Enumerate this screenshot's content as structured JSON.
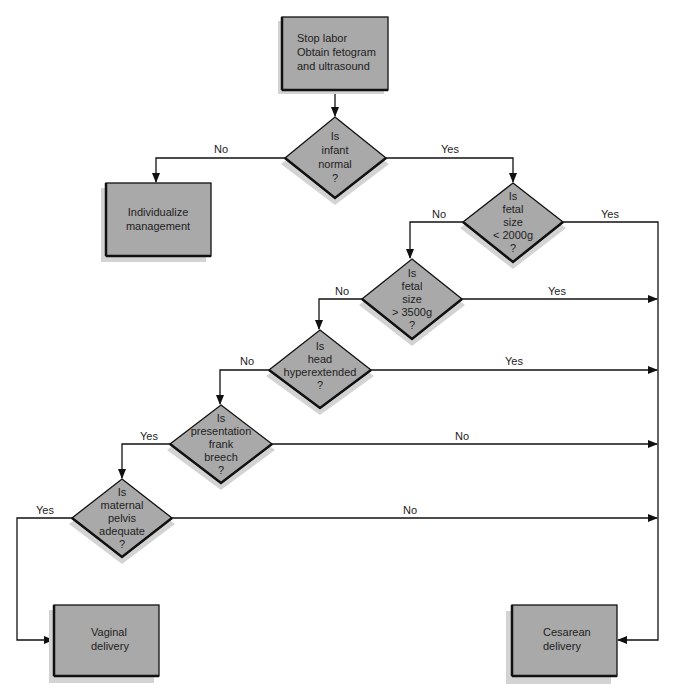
{
  "colors": {
    "node_fill": "#a9a9a9",
    "shadow": "#d3d3d3",
    "stroke": "#111111",
    "background": "#ffffff"
  },
  "nodes": {
    "start": {
      "type": "process",
      "lines": [
        "Stop labor",
        "Obtain fetogram",
        "and ultrasound"
      ]
    },
    "individualize": {
      "type": "process",
      "lines": [
        "Individualize",
        "management"
      ]
    },
    "q_infant_normal": {
      "type": "decision",
      "lines": [
        "Is",
        "infant",
        "normal",
        "?"
      ]
    },
    "q_size_lt_2000": {
      "type": "decision",
      "lines": [
        "Is",
        "fetal",
        "size",
        "< 2000g",
        "?"
      ]
    },
    "q_size_gt_3500": {
      "type": "decision",
      "lines": [
        "Is",
        "fetal",
        "size",
        "> 3500g",
        "?"
      ]
    },
    "q_head_hyperextended": {
      "type": "decision",
      "lines": [
        "Is",
        "head",
        "hyperextended",
        "?"
      ]
    },
    "q_frank_breech": {
      "type": "decision",
      "lines": [
        "Is",
        "presentation",
        "frank",
        "breech",
        "?"
      ]
    },
    "q_pelvis_adequate": {
      "type": "decision",
      "lines": [
        "Is",
        "maternal",
        "pelvis",
        "adequate",
        "?"
      ]
    },
    "vaginal": {
      "type": "terminal",
      "lines": [
        "Vaginal",
        "delivery"
      ]
    },
    "cesarean": {
      "type": "terminal",
      "lines": [
        "Cesarean",
        "delivery"
      ]
    }
  },
  "edges": [
    {
      "from": "start",
      "to": "q_infant_normal",
      "label": ""
    },
    {
      "from": "q_infant_normal",
      "to": "individualize",
      "label": "No"
    },
    {
      "from": "q_infant_normal",
      "to": "q_size_lt_2000",
      "label": "Yes"
    },
    {
      "from": "q_size_lt_2000",
      "to": "cesarean",
      "label": "Yes"
    },
    {
      "from": "q_size_lt_2000",
      "to": "q_size_gt_3500",
      "label": "No"
    },
    {
      "from": "q_size_gt_3500",
      "to": "cesarean",
      "label": "Yes"
    },
    {
      "from": "q_size_gt_3500",
      "to": "q_head_hyperextended",
      "label": "No"
    },
    {
      "from": "q_head_hyperextended",
      "to": "cesarean",
      "label": "Yes"
    },
    {
      "from": "q_head_hyperextended",
      "to": "q_frank_breech",
      "label": "No"
    },
    {
      "from": "q_frank_breech",
      "to": "q_pelvis_adequate",
      "label": "Yes"
    },
    {
      "from": "q_frank_breech",
      "to": "cesarean",
      "label": "No"
    },
    {
      "from": "q_pelvis_adequate",
      "to": "vaginal",
      "label": "Yes"
    },
    {
      "from": "q_pelvis_adequate",
      "to": "cesarean",
      "label": "No"
    }
  ],
  "labels": {
    "infant_no": "No",
    "infant_yes": "Yes",
    "lt2000_no": "No",
    "lt2000_yes": "Yes",
    "gt3500_no": "No",
    "gt3500_yes": "Yes",
    "head_no": "No",
    "head_yes": "Yes",
    "breech_yes": "Yes",
    "breech_no": "No",
    "pelvis_yes": "Yes",
    "pelvis_no": "No"
  }
}
